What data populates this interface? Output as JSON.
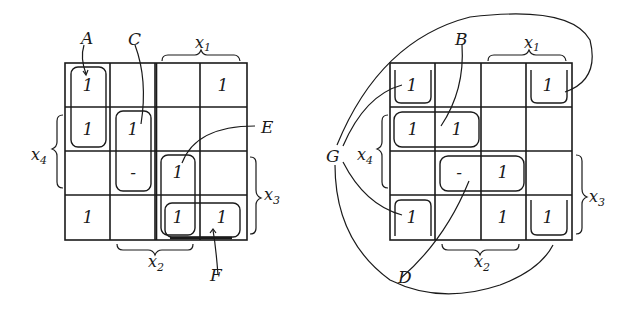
{
  "colors": {
    "ink": "#1a1a1a",
    "background": "#ffffff"
  },
  "left_map": {
    "cells": [
      [
        "1",
        "",
        "",
        "1"
      ],
      [
        "1",
        "1",
        "",
        ""
      ],
      [
        "",
        "-",
        "1",
        ""
      ],
      [
        "1",
        "",
        "1",
        "1"
      ]
    ],
    "variables": {
      "top": "x1",
      "left": "x4",
      "right": "x3",
      "bottom": "x2"
    },
    "group_labels": [
      "A",
      "C",
      "E",
      "F"
    ]
  },
  "right_map": {
    "cells": [
      [
        "1",
        "",
        "",
        "1"
      ],
      [
        "1",
        "1",
        "",
        ""
      ],
      [
        "",
        "-",
        "1",
        ""
      ],
      [
        "1",
        "",
        "1",
        "1"
      ]
    ],
    "variables": {
      "top": "x1",
      "left": "x4",
      "right": "x3",
      "bottom": "x2"
    },
    "group_labels": [
      "B",
      "D",
      "G"
    ]
  },
  "text": {
    "A": "A",
    "B": "B",
    "C": "C",
    "D": "D",
    "E": "E",
    "F": "F",
    "G": "G",
    "x1": "x",
    "x1_sub": "1",
    "x2": "x",
    "x2_sub": "2",
    "x3": "x",
    "x3_sub": "3",
    "x4": "x",
    "x4_sub": "4",
    "one": "1",
    "dash": "–"
  }
}
